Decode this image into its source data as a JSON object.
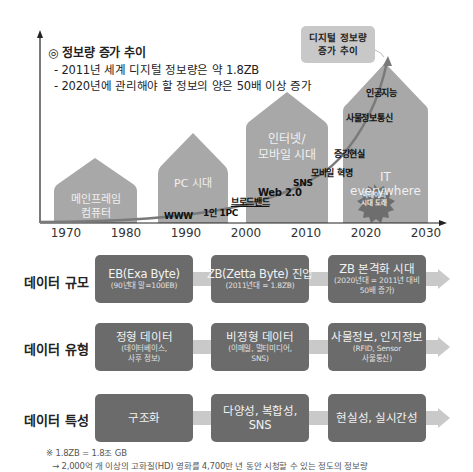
{
  "chart": {
    "title": "◎ 정보량 증가 추이",
    "bullets": [
      "- 2011년 세계 디지털 정보량은 약 1.8ZB",
      "- 2020년에 관리해야 할 정보의 양은 50배 이상 증가"
    ],
    "callout": {
      "line1": "디지털 정보량",
      "line2": "증가 추이"
    },
    "years": [
      "1970",
      "1980",
      "1990",
      "2000",
      "2010",
      "2020",
      "2030"
    ],
    "eras": [
      {
        "line1": "메인프레임",
        "line2": "컴퓨터"
      },
      {
        "line1": "PC 시대",
        "line2": ""
      },
      {
        "line1": "인터넷/",
        "line2": "모바일 시대"
      },
      {
        "line1": "IT",
        "line2": "everywhere"
      }
    ],
    "milestones": [
      "WWW",
      "1인 1PC",
      "브로드밴드",
      "Web 2.0",
      "SNS",
      "모바일 혁명",
      "증강현실",
      "사물정보통신",
      "인공지능"
    ],
    "burst": {
      "line1": "빅데이터",
      "line2": "시대 도래"
    },
    "colors": {
      "house": "#a8a8a8",
      "curve": "#7a7a7a",
      "burst": "#6e6e6e",
      "box": "#6b6b6b",
      "bar": "#c9c9c9"
    }
  },
  "rows": [
    {
      "label": "데이터 규모",
      "boxes": [
        {
          "main": "EB(Exa Byte)",
          "sub1": "(90년대 말=100EB)",
          "sub2": ""
        },
        {
          "main": "ZB(Zetta Byte) 진입",
          "sub1": "(2011년대 = 1.8ZB)",
          "sub2": ""
        },
        {
          "main": "ZB 본격화 시대",
          "sub1": "(2020년대 = 2011년 대비",
          "sub2": "50배 증가)"
        }
      ]
    },
    {
      "label": "데이터 유형",
      "boxes": [
        {
          "main": "정형 데이터",
          "sub1": "(데이터베이스,",
          "sub2": "사후 정보)"
        },
        {
          "main": "비정형 데이터",
          "sub1": "(이메일, 멀티미디어,",
          "sub2": "SNS)"
        },
        {
          "main": "사물정보, 인지정보",
          "sub1": "(RFID, Sensor",
          "sub2": "사물통신)"
        }
      ]
    },
    {
      "label": "데이터 특성",
      "boxes": [
        {
          "main": "구조화",
          "sub1": "",
          "sub2": ""
        },
        {
          "main": "다양성, 복합성,",
          "main2": "SNS",
          "sub1": "",
          "sub2": ""
        },
        {
          "main": "현실성, 실시간성",
          "sub1": "",
          "sub2": ""
        }
      ]
    }
  ],
  "footnote": {
    "line1": "※ 1.8ZB = 1.8조 GB",
    "line2": "→ 2,000억 개 이상의 고화질(HD) 영화를 4,700만 년 동안 시청할 수 있는 정도의 정보량"
  }
}
